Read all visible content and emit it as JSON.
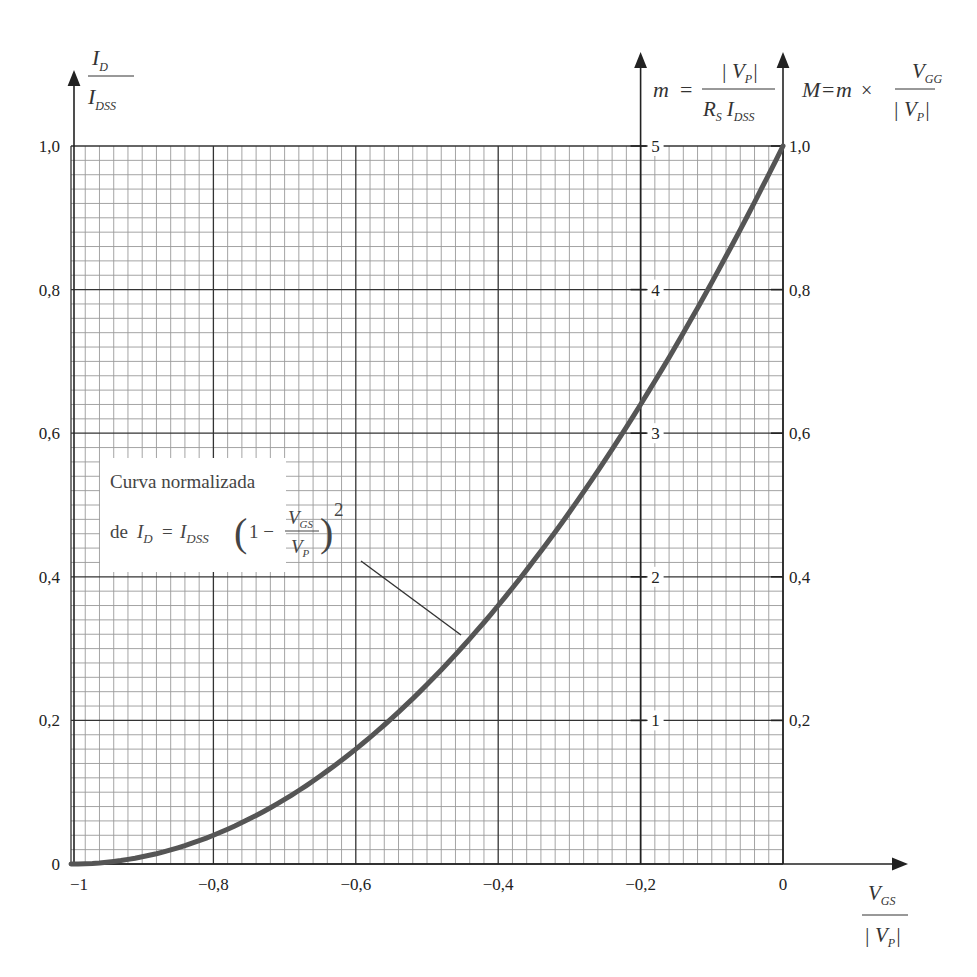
{
  "chart_data": {
    "type": "line",
    "title": "",
    "xlabel": "V_GS / |V_P|",
    "ylabel": "I_D / I_DSS",
    "xlim": [
      -1,
      0
    ],
    "ylim": [
      0,
      1
    ],
    "grid": true,
    "legend": null,
    "x_ticks": [
      "-1",
      "-0,8",
      "-0,6",
      "-0,4",
      "-0,2",
      "0"
    ],
    "y_ticks": [
      "0",
      "0,2",
      "0,4",
      "0,6",
      "0,8",
      "1,0"
    ],
    "secondary_axes": [
      {
        "name": "m",
        "label": "m = |V_P| / (R_S I_DSS)",
        "position_x": -0.2,
        "ticks": [
          "1",
          "2",
          "3",
          "4",
          "5"
        ],
        "tick_y_positions": [
          0.2,
          0.4,
          0.6,
          0.8,
          1.0
        ]
      },
      {
        "name": "M",
        "label": "M = m × V_GG / |V_P|",
        "position_x": 0,
        "ticks": [
          "0,2",
          "0,4",
          "0,6",
          "0,8",
          "1,0"
        ],
        "tick_y_positions": [
          0.2,
          0.4,
          0.6,
          0.8,
          1.0
        ]
      }
    ],
    "series": [
      {
        "name": "Curva normalizada de I_D = I_DSS (1 - V_GS/V_P)^2",
        "x": [
          -1.0,
          -0.9,
          -0.8,
          -0.7,
          -0.6,
          -0.5,
          -0.4,
          -0.3,
          -0.2,
          -0.1,
          0.0
        ],
        "values": [
          0.0,
          0.01,
          0.04,
          0.09,
          0.16,
          0.25,
          0.36,
          0.49,
          0.64,
          0.81,
          1.0
        ]
      }
    ],
    "annotations": [
      {
        "text_line1": "Curva normalizada",
        "text_line2": "de I_D = I_DSS (1 − V_GS / V_P)^2",
        "points_to": [
          -0.44,
          0.31
        ]
      }
    ]
  },
  "labels": {
    "y_left": {
      "num": "I",
      "num_sub": "D",
      "den": "I",
      "den_sub": "DSS"
    },
    "m_axis": {
      "m": "m",
      "eq": "=",
      "num": "| V",
      "num_sub": "P",
      "num_end": "|",
      "den_a": "R",
      "den_a_sub": "S",
      "den_b": "I",
      "den_b_sub": "DSS"
    },
    "M_axis": {
      "M": "M",
      "eq": "=",
      "m": "m",
      "times": "×",
      "num": "V",
      "num_sub": "GG",
      "den": "| V",
      "den_sub": "P",
      "den_end": "|"
    },
    "x_axis": {
      "num": "V",
      "num_sub": "GS",
      "den": "| V",
      "den_sub": "P",
      "den_end": "|"
    },
    "annotation": {
      "line1": "Curva normalizada",
      "de": "de",
      "I": "I",
      "I_sub": "D",
      "eq": "=",
      "I2": "I",
      "I2_sub": "DSS",
      "one_minus": "1 −",
      "frac_num": "V",
      "frac_num_sub": "GS",
      "frac_den": "V",
      "frac_den_sub": "P",
      "exp": "2"
    }
  },
  "colors": {
    "grid_minor": "#9a9a9a",
    "grid_major": "#333333",
    "curve": "#555555",
    "axis": "#222222"
  }
}
